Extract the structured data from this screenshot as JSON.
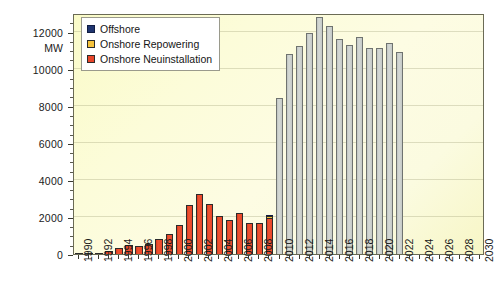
{
  "chart_data": {
    "type": "bar",
    "title": "",
    "subtitle": "",
    "xlabel": "",
    "ylabel": "MW",
    "ylim": [
      0,
      13000
    ],
    "yticks": [
      0,
      2000,
      4000,
      6000,
      8000,
      10000,
      12000
    ],
    "ytick_labels": [
      "0",
      "2000",
      "4000",
      "6000",
      "8000",
      "10000",
      "12000"
    ],
    "grid": true,
    "stacked": true,
    "legend_position": "top-left",
    "legend": [
      {
        "name": "Offshore",
        "color": "#1f3570"
      },
      {
        "name": "Onshore Repowering",
        "color": "#f5c23c"
      },
      {
        "name": "Onshore Neuinstallation",
        "color": "#e8452a"
      }
    ],
    "categories": [
      "1990",
      "1991",
      "1992",
      "1993",
      "1994",
      "1995",
      "1996",
      "1997",
      "1998",
      "1999",
      "2000",
      "2001",
      "2002",
      "2003",
      "2004",
      "2005",
      "2006",
      "2007",
      "2008",
      "2009",
      "2010",
      "2011",
      "2012",
      "2013",
      "2014",
      "2015",
      "2016",
      "2017",
      "2018",
      "2019",
      "2020",
      "2021",
      "2022",
      "2023",
      "2024",
      "2025",
      "2026",
      "2027",
      "2028",
      "2029",
      "2030"
    ],
    "xtick_labels": [
      "1990",
      "1992",
      "1994",
      "1996",
      "1998",
      "2000",
      "2002",
      "2004",
      "2006",
      "2008",
      "2010",
      "2012",
      "2014",
      "2016",
      "2018",
      "2020",
      "2022",
      "2024",
      "2026",
      "2028",
      "2030"
    ],
    "series": [
      {
        "name": "Onshore Neuinstallation",
        "color": "#e8452a",
        "values": [
          40,
          60,
          80,
          160,
          320,
          500,
          430,
          530,
          790,
          1070,
          1580,
          2640,
          3250,
          2680,
          2050,
          1810,
          2230,
          1660,
          1660,
          1920,
          1490,
          1950,
          2440,
          2900,
          4280,
          3540,
          4630,
          5030,
          2400,
          1000,
          0,
          0,
          0,
          0,
          0,
          0,
          0,
          0,
          0,
          0,
          0
        ]
      },
      {
        "name": "Onshore Repowering",
        "color": "#f5c23c",
        "values": [
          0,
          0,
          0,
          0,
          0,
          0,
          0,
          0,
          0,
          0,
          0,
          0,
          0,
          0,
          0,
          0,
          0,
          0,
          0,
          150,
          180,
          230,
          290,
          380,
          500,
          530,
          760,
          980,
          350,
          230,
          0,
          0,
          0,
          0,
          0,
          0,
          0,
          0,
          0,
          0,
          0
        ]
      },
      {
        "name": "Offshore",
        "color": "#1f3570",
        "values": [
          0,
          0,
          0,
          0,
          0,
          0,
          0,
          0,
          0,
          0,
          0,
          0,
          0,
          0,
          0,
          0,
          0,
          0,
          0,
          30,
          110,
          120,
          160,
          240,
          530,
          1980,
          820,
          1250,
          1100,
          640,
          0,
          0,
          0,
          0,
          0,
          0,
          0,
          0,
          0,
          0,
          0
        ]
      },
      {
        "name": "Forecast",
        "color": "#c9cdc9",
        "values": [
          0,
          0,
          0,
          0,
          0,
          0,
          0,
          0,
          0,
          0,
          0,
          0,
          0,
          0,
          0,
          0,
          0,
          0,
          0,
          0,
          8400,
          10800,
          11200,
          11900,
          12800,
          12300,
          11600,
          11300,
          11700,
          11100,
          11100,
          11400,
          10900,
          0,
          0,
          0,
          0,
          0,
          0,
          0,
          0
        ]
      }
    ],
    "forecast_note": "Bars from 2020 onward shown in grey (projection)"
  },
  "axes": {
    "y_unit_label": "MW"
  }
}
